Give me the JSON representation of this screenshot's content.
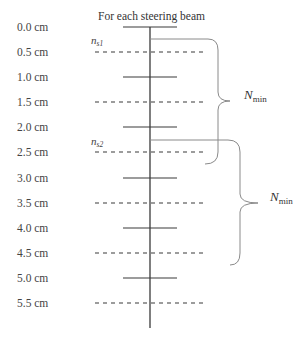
{
  "diagram": {
    "title": "For each steering beam",
    "depth_labels": [
      "0.0 cm",
      "0.5 cm",
      "1.0 cm",
      "1.5 cm",
      "2.0 cm",
      "2.5 cm",
      "3.0 cm",
      "3.5 cm",
      "4.0 cm",
      "4.5 cm",
      "5.0 cm",
      "5.5 cm"
    ],
    "line_styles": [
      "solid",
      "dashed",
      "solid",
      "dashed",
      "solid",
      "dashed",
      "solid",
      "dashed",
      "solid",
      "dashed",
      "solid",
      "dashed"
    ],
    "markers": [
      {
        "base": "n",
        "sub": "s1",
        "row": 1
      },
      {
        "base": "n",
        "sub": "s2",
        "row": 5
      }
    ],
    "braces": [
      {
        "label_base": "N",
        "label_sub": "min",
        "from_row": 0.5,
        "to_row": 5.5
      },
      {
        "label_base": "N",
        "label_sub": "min",
        "from_row": 4.5,
        "to_row": 9.5
      }
    ],
    "colors": {
      "line": "#3a3a3a",
      "brace": "#8a8a8a",
      "text": "#444444"
    }
  }
}
